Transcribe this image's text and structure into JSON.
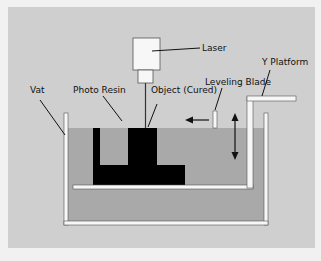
{
  "labels": {
    "laser": "Laser",
    "y_platform": "Y Platform",
    "leveling_blade": "Leveling Blade",
    "vat": "Vat",
    "photo_resin": "Photo Resin",
    "object": "Object (Cured)"
  },
  "colors": {
    "panel": "#cfcfcf",
    "resin": "#a9a9a9",
    "object": "#000000",
    "white_parts": "#f7f7f7",
    "outline": "#444444"
  }
}
